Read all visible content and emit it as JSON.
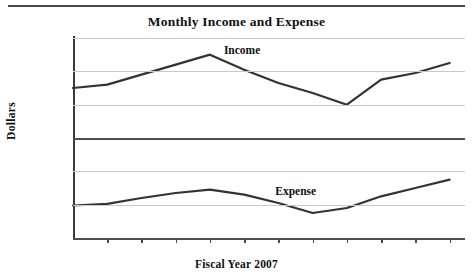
{
  "chart_data": {
    "type": "line",
    "title": "Monthly Income and Expense",
    "xlabel": "Fiscal Year 2007",
    "ylabel": "Dollars",
    "categories": [
      "Jan.",
      "Feb.",
      "Mar.",
      "Apr.",
      "May",
      "June",
      "July",
      "Aug.",
      "Sept.",
      "Oct.",
      "Nov.",
      "Dec."
    ],
    "ytick_labels": [
      "60,000",
      "40,000",
      "20,000",
      "0",
      "(20,000)",
      "(40,000)",
      "(60,000)"
    ],
    "ytick_values": [
      60000,
      40000,
      20000,
      0,
      -20000,
      -40000,
      -60000
    ],
    "ylim": [
      -60000,
      60000
    ],
    "grid": true,
    "legend_position": "inline-annotation",
    "series": [
      {
        "name": "Income",
        "color": "#333333",
        "values": [
          30000,
          32000,
          38000,
          44000,
          50000,
          41000,
          33000,
          27000,
          20000,
          35000,
          39000,
          45000
        ]
      },
      {
        "name": "Expense",
        "color": "#333333",
        "values": [
          -40500,
          -39500,
          -36000,
          -33000,
          -31000,
          -34000,
          -39000,
          -45000,
          -42000,
          -35000,
          -30000,
          -25000
        ]
      }
    ],
    "annotations": [
      {
        "text": "Income",
        "series": "Income"
      },
      {
        "text": "Expense",
        "series": "Expense"
      }
    ]
  }
}
